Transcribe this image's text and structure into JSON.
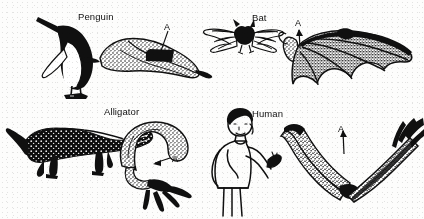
{
  "figure": {
    "medium": "black-and-white scanned line drawing",
    "marker_letter": "A",
    "marker_meaning": "humerus",
    "background_color": "#ffffff",
    "ink_color": "#101010"
  },
  "panels": [
    {
      "id": "penguin",
      "label": "Penguin",
      "animal_art": "penguin-silhouette",
      "limb_art": "penguin-flipper-skeleton",
      "marker": "A",
      "marker_pointer": "down"
    },
    {
      "id": "bat",
      "label": "Bat",
      "animal_art": "bat-silhouette",
      "limb_art": "bat-wing-skeleton",
      "marker": "A",
      "marker_pointer": "up"
    },
    {
      "id": "alligator",
      "label": "Alligator",
      "animal_art": "alligator-silhouette",
      "limb_art": "alligator-forelimb-skeleton",
      "marker": "A",
      "marker_pointer": "left"
    },
    {
      "id": "human",
      "label": "Human",
      "animal_art": "human-figure",
      "limb_art": "human-arm-skeleton",
      "marker": "A",
      "marker_pointer": "up"
    }
  ]
}
